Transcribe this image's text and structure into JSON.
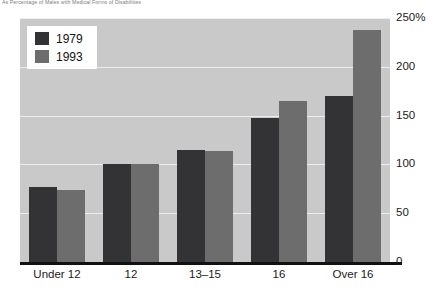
{
  "caption": "As Percentage of Males with Medical Forms of Disabilities",
  "chart_data": {
    "type": "bar",
    "title": "",
    "xlabel": "",
    "ylabel": "",
    "categories": [
      "Under 12",
      "12",
      "13–15",
      "16",
      "Over 16"
    ],
    "series": [
      {
        "name": "1979",
        "color": "#333335",
        "values": [
          77,
          100,
          115,
          148,
          170
        ]
      },
      {
        "name": "1993",
        "color": "#6d6d6e",
        "values": [
          74,
          100,
          114,
          165,
          238
        ]
      }
    ],
    "ylim": [
      0,
      250
    ],
    "yticks": [
      0,
      50,
      100,
      150,
      200,
      250
    ],
    "ytick_labels": [
      "0",
      "50",
      "100",
      "150",
      "200",
      "250%"
    ],
    "grid": true,
    "grid_color": "#eceded",
    "legend_position": "top-left",
    "plot_background": "#c9c9c9"
  }
}
